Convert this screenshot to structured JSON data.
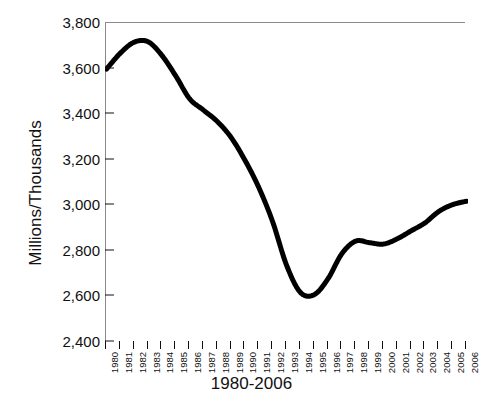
{
  "chart_data": {
    "type": "line",
    "title": "",
    "xlabel": "1980-2006",
    "ylabel": "Millions/Thousands",
    "ylim": [
      2400,
      3800
    ],
    "ytick_step": 200,
    "ytick_labels": [
      "3,800",
      "3,600",
      "3,400",
      "3,200",
      "3,000",
      "2,800",
      "2,600",
      "2,400"
    ],
    "ytick_values": [
      3800,
      3600,
      3400,
      3200,
      3000,
      2800,
      2600,
      2400
    ],
    "grid": false,
    "legend": false,
    "line_color": "#000000",
    "line_width": 5,
    "frame_color": "#8a8a8a",
    "categories": [
      "1980",
      "1981",
      "1982",
      "1983",
      "1984",
      "1985",
      "1986",
      "1987",
      "1988",
      "1989",
      "1990",
      "1991",
      "1992",
      "1993",
      "1994",
      "1995",
      "1996",
      "1997",
      "1998",
      "1999",
      "2000",
      "2001",
      "2002",
      "2003",
      "2004",
      "2005",
      "2006"
    ],
    "x": [
      1980,
      1981,
      1982,
      1983,
      1984,
      1985,
      1986,
      1987,
      1988,
      1989,
      1990,
      1991,
      1992,
      1993,
      1994,
      1995,
      1996,
      1997,
      1998,
      1999,
      2000,
      2001,
      2002,
      2003,
      2004,
      2005,
      2006
    ],
    "values": [
      3600,
      3670,
      3718,
      3720,
      3660,
      3570,
      3470,
      3420,
      3370,
      3300,
      3200,
      3080,
      2930,
      2740,
      2620,
      2610,
      2680,
      2790,
      2845,
      2838,
      2832,
      2855,
      2890,
      2925,
      2975,
      3005,
      3020
    ],
    "series": [
      {
        "name": "series-1",
        "values": [
          3600,
          3670,
          3718,
          3720,
          3660,
          3570,
          3470,
          3420,
          3370,
          3300,
          3200,
          3080,
          2930,
          2740,
          2620,
          2610,
          2680,
          2790,
          2845,
          2838,
          2832,
          2855,
          2890,
          2925,
          2975,
          3005,
          3020
        ]
      }
    ],
    "annotations": {
      "peak": {
        "year": "1983",
        "value": 3720
      },
      "trough": {
        "year": "1994",
        "value": 2610
      },
      "end": {
        "year": "2006",
        "value": 3020
      }
    }
  },
  "artifacts": {
    "top_text": "",
    "bottom_text": ""
  }
}
